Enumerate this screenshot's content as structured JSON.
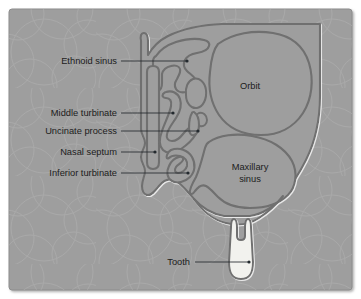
{
  "figure": {
    "frame": {
      "background_color": "#9e9e9e",
      "border_color": "#8a8a8a",
      "outer_background": "#ffffff"
    },
    "palette": {
      "tissue_fill": "#9e9e9e",
      "outline_stroke": "#6f6f6f",
      "outline_highlight": "#c9c9c9",
      "tooth_fill": "#f2f2ee",
      "tooth_stroke": "#6f6f6f",
      "leader_color": "#23292e",
      "label_color": "#1c1c1c",
      "texture_color": "#b4b4b4"
    },
    "callouts": [
      {
        "id": "ethmoid-sinus",
        "label": "Ethnoid sinus",
        "label_x": 117,
        "label_y": 64,
        "anchor": "end",
        "leader": "M121,61 L187,61",
        "dot_x": 187,
        "dot_y": 61
      },
      {
        "id": "middle-turbinate",
        "label": "Middle turbinate",
        "label_x": 117,
        "label_y": 116,
        "anchor": "end",
        "leader": "M121,113 L173,113",
        "dot_x": 173,
        "dot_y": 113
      },
      {
        "id": "uncinate-process",
        "label": "Uncinate process",
        "label_x": 117,
        "label_y": 134,
        "anchor": "end",
        "leader": "M121,131 L198,131",
        "dot_x": 198,
        "dot_y": 131
      },
      {
        "id": "nasal-septum",
        "label": "Nasal septum",
        "label_x": 117,
        "label_y": 155,
        "anchor": "end",
        "leader": "M121,152 L155,152",
        "dot_x": 155,
        "dot_y": 152
      },
      {
        "id": "inferior-turbinate",
        "label": "Inferior turbinate",
        "label_x": 117,
        "label_y": 176,
        "anchor": "end",
        "leader": "M121,173 L188,173",
        "dot_x": 188,
        "dot_y": 173
      },
      {
        "id": "tooth",
        "label": "Tooth",
        "label_x": 190,
        "label_y": 265,
        "anchor": "end",
        "leader": "M195,262 L249,262",
        "dot_x": 249,
        "dot_y": 262
      }
    ],
    "inline_labels": [
      {
        "id": "orbit",
        "lines": [
          "Orbit"
        ],
        "x": 250,
        "y": 89
      },
      {
        "id": "maxillary-sinus",
        "lines": [
          "Maxillary",
          "sinus"
        ],
        "x": 250,
        "y": 170
      }
    ]
  }
}
